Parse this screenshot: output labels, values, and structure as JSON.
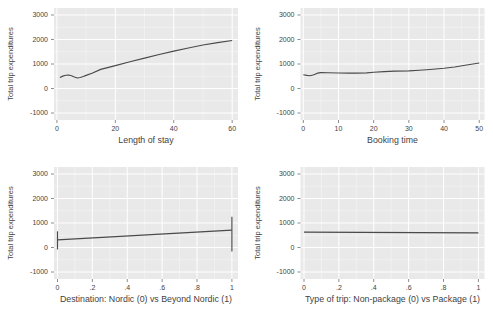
{
  "figure": {
    "background": "#ffffff"
  },
  "theme": {
    "panel_bg": "#e9e9e9",
    "grid_major": "#ffffff",
    "grid_minor": "#f4f4f4",
    "line_color": "#4a4a4a",
    "tick_color": "#6e6e6e",
    "text_color": "#3f3f3f"
  },
  "chart_data": [
    {
      "type": "line",
      "name": "length-of-stay",
      "xlabel": "Length of stay",
      "ylabel": "Total trip expenditures",
      "xlim": [
        -1,
        62
      ],
      "ylim": [
        -1285,
        3285
      ],
      "xticks": [
        0,
        20,
        40,
        60
      ],
      "xtick_labels": [
        "0",
        "20",
        "40",
        "60"
      ],
      "xminor": [
        10,
        30,
        50
      ],
      "yticks": [
        -1000,
        0,
        1000,
        2000,
        3000
      ],
      "ytick_labels": [
        "-1000",
        "0",
        "1000",
        "2000",
        "3000"
      ],
      "yminor": [
        -500,
        500,
        1500,
        2500
      ],
      "grid": true,
      "legend": "none",
      "series": [
        {
          "name": "lowess-smooth",
          "x": [
            1,
            2,
            3,
            4,
            5,
            6,
            7,
            8,
            9,
            10,
            12,
            15,
            20,
            25,
            30,
            35,
            40,
            45,
            50,
            55,
            60
          ],
          "y": [
            450,
            505,
            540,
            550,
            520,
            470,
            430,
            450,
            490,
            535,
            625,
            780,
            935,
            1090,
            1240,
            1385,
            1525,
            1655,
            1775,
            1875,
            1960
          ]
        }
      ]
    },
    {
      "type": "line",
      "name": "booking-time",
      "xlabel": "Booking time",
      "ylabel": "Total trip expenditures",
      "xlim": [
        -0.8,
        51.5
      ],
      "ylim": [
        -1285,
        3285
      ],
      "xticks": [
        0,
        10,
        20,
        30,
        40,
        50
      ],
      "xtick_labels": [
        "0",
        "10",
        "20",
        "30",
        "40",
        "50"
      ],
      "xminor": [
        5,
        15,
        25,
        35,
        45
      ],
      "yticks": [
        -1000,
        0,
        1000,
        2000,
        3000
      ],
      "ytick_labels": [
        "-1000",
        "0",
        "1000",
        "2000",
        "3000"
      ],
      "yminor": [
        -500,
        500,
        1500,
        2500
      ],
      "grid": true,
      "legend": "none",
      "series": [
        {
          "name": "lowess-smooth",
          "x": [
            0,
            1,
            2,
            3,
            4,
            5,
            7,
            10,
            13,
            15,
            18,
            20,
            23,
            26,
            30,
            33,
            36,
            40,
            43,
            46,
            50
          ],
          "y": [
            560,
            535,
            520,
            560,
            625,
            650,
            645,
            635,
            628,
            625,
            640,
            663,
            688,
            708,
            722,
            745,
            775,
            828,
            878,
            948,
            1040
          ]
        }
      ]
    },
    {
      "type": "line",
      "name": "destination",
      "xlabel": "Destination: Nordic (0) vs Beyond Nordic (1)",
      "ylabel": "Total trip expenditures",
      "xlim": [
        -0.02,
        1.035
      ],
      "ylim": [
        -1285,
        3285
      ],
      "xticks": [
        0,
        0.2,
        0.4,
        0.6,
        0.8,
        1
      ],
      "xtick_labels": [
        "0",
        ".2",
        ".4",
        ".6",
        ".8",
        "1"
      ],
      "xminor": [
        0.1,
        0.3,
        0.5,
        0.7,
        0.9
      ],
      "yticks": [
        -1000,
        0,
        1000,
        2000,
        3000
      ],
      "ytick_labels": [
        "-1000",
        "0",
        "1000",
        "2000",
        "3000"
      ],
      "yminor": [
        -500,
        500,
        1500,
        2500
      ],
      "grid": true,
      "legend": "none",
      "series": [
        {
          "name": "lowess-smooth",
          "x": [
            0,
            1
          ],
          "y": [
            310,
            710
          ]
        },
        {
          "name": "endpoint-spike-left",
          "x": [
            0,
            0
          ],
          "y": [
            -80,
            660
          ]
        },
        {
          "name": "endpoint-spike-right",
          "x": [
            1,
            1
          ],
          "y": [
            -160,
            1255
          ]
        }
      ]
    },
    {
      "type": "line",
      "name": "trip-type",
      "xlabel": "Type of trip: Non-package (0) vs Package (1)",
      "ylabel": "Total trip expenditures",
      "xlim": [
        -0.02,
        1.035
      ],
      "ylim": [
        -1285,
        3285
      ],
      "xticks": [
        0,
        0.2,
        0.4,
        0.6,
        0.8,
        1
      ],
      "xtick_labels": [
        "0",
        ".2",
        ".4",
        ".6",
        ".8",
        "1"
      ],
      "xminor": [
        0.1,
        0.3,
        0.5,
        0.7,
        0.9
      ],
      "yticks": [
        -1000,
        0,
        1000,
        2000,
        3000
      ],
      "ytick_labels": [
        "-1000",
        "0",
        "1000",
        "2000",
        "3000"
      ],
      "yminor": [
        -500,
        500,
        1500,
        2500
      ],
      "grid": true,
      "legend": "none",
      "series": [
        {
          "name": "lowess-smooth",
          "x": [
            0,
            1
          ],
          "y": [
            628,
            600
          ]
        }
      ]
    }
  ]
}
